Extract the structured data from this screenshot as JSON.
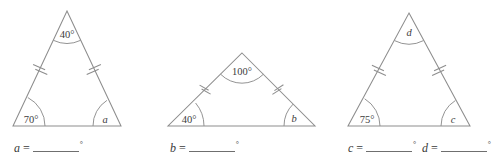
{
  "worksheet": {
    "type": "geometry-angle-worksheet",
    "description": "Three isosceles triangles with marked congruent sides and angles to find",
    "degree_symbol": "°",
    "equals_sign": "="
  },
  "figures": [
    {
      "id": "figure-a",
      "shape": "isosceles-triangle",
      "congruent_side_marks": "double-tick",
      "angles": [
        {
          "position": "apex",
          "label": "40°",
          "known": true,
          "value": 40
        },
        {
          "position": "bottom-left",
          "label": "70°",
          "known": true,
          "value": 70
        },
        {
          "position": "bottom-right",
          "label": "a",
          "known": false,
          "variable": "a"
        }
      ]
    },
    {
      "id": "figure-b",
      "shape": "isosceles-triangle",
      "congruent_side_marks": "double-tick",
      "angles": [
        {
          "position": "apex",
          "label": "100°",
          "known": true,
          "value": 100
        },
        {
          "position": "bottom-left",
          "label": "40°",
          "known": true,
          "value": 40
        },
        {
          "position": "bottom-right",
          "label": "b",
          "known": false,
          "variable": "b"
        }
      ]
    },
    {
      "id": "figure-c",
      "shape": "isosceles-triangle",
      "congruent_side_marks": "double-tick",
      "angles": [
        {
          "position": "apex",
          "label": "d",
          "known": false,
          "variable": "d"
        },
        {
          "position": "bottom-left",
          "label": "75°",
          "known": true,
          "value": 75
        },
        {
          "position": "bottom-right",
          "label": "c",
          "known": false,
          "variable": "c"
        }
      ]
    }
  ],
  "answers": [
    {
      "id": "answer-a",
      "variable": "a",
      "equals": "=",
      "value": "",
      "unit": "°"
    },
    {
      "id": "answer-b",
      "variable": "b",
      "equals": "=",
      "value": "",
      "unit": "°"
    },
    {
      "id": "answer-c",
      "variable": "c",
      "equals": "=",
      "value": "",
      "unit": "°"
    },
    {
      "id": "answer-d",
      "variable": "d",
      "equals": "=",
      "value": "",
      "unit": "°"
    }
  ],
  "style": {
    "stroke_color": "#8d8d8d",
    "text_color": "#3a3a3a",
    "background": "#ffffff"
  }
}
